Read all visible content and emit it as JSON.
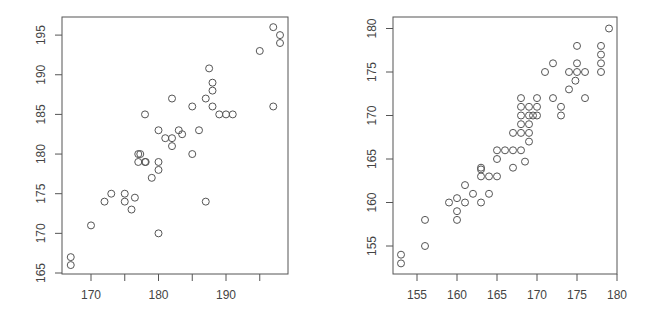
{
  "chart_data": [
    {
      "type": "scatter",
      "title": "",
      "xlabel": "",
      "ylabel": "",
      "xlim": [
        166,
        198.5
      ],
      "ylim": [
        164.8,
        197.5
      ],
      "xticks": [
        170,
        175,
        180,
        185,
        190,
        195
      ],
      "xtick_labels": [
        "170",
        "",
        "180",
        "",
        "190",
        ""
      ],
      "yticks": [
        165,
        170,
        175,
        180,
        185,
        190,
        195
      ],
      "ytick_labels": [
        "165",
        "170",
        "175",
        "180",
        "185",
        "190",
        "195"
      ],
      "grid": false,
      "legend": null,
      "marker": "open-circle",
      "color": "#555555",
      "frame": {
        "left": 62,
        "top": 17,
        "right": 288,
        "bottom": 274
      },
      "axis_px": {
        "x0": 170,
        "x0px": 91,
        "xscale": 6.75,
        "y0": 165,
        "y0px": 273,
        "yscale": 7.93
      },
      "points": [
        [
          167,
          167
        ],
        [
          167,
          166
        ],
        [
          170,
          171
        ],
        [
          172,
          174
        ],
        [
          173,
          175
        ],
        [
          175,
          175
        ],
        [
          175,
          174
        ],
        [
          176,
          173
        ],
        [
          176.5,
          174.5
        ],
        [
          177,
          180
        ],
        [
          177.3,
          180
        ],
        [
          177,
          179
        ],
        [
          178,
          179
        ],
        [
          178.1,
          179
        ],
        [
          178,
          185
        ],
        [
          179,
          177
        ],
        [
          180,
          179
        ],
        [
          180,
          178
        ],
        [
          180,
          183
        ],
        [
          180,
          170
        ],
        [
          181,
          182
        ],
        [
          182,
          182
        ],
        [
          182,
          181
        ],
        [
          182,
          187
        ],
        [
          183,
          183
        ],
        [
          183.5,
          182.5
        ],
        [
          185,
          186
        ],
        [
          185,
          180
        ],
        [
          186,
          183
        ],
        [
          187,
          187
        ],
        [
          187,
          174
        ],
        [
          187.5,
          190.8
        ],
        [
          188,
          189
        ],
        [
          188,
          188
        ],
        [
          188,
          186
        ],
        [
          189,
          185
        ],
        [
          190,
          185
        ],
        [
          191,
          185
        ],
        [
          195,
          193
        ],
        [
          197,
          196
        ],
        [
          197,
          186
        ],
        [
          198,
          195
        ],
        [
          198,
          194
        ]
      ]
    },
    {
      "type": "scatter",
      "title": "",
      "xlabel": "",
      "ylabel": "",
      "xlim": [
        152.9,
        180
      ],
      "ylim": [
        151.8,
        181.5
      ],
      "xticks": [
        155,
        160,
        165,
        170,
        175,
        180
      ],
      "xtick_labels": [
        "155",
        "160",
        "165",
        "170",
        "175",
        "180"
      ],
      "yticks": [
        155,
        160,
        165,
        170,
        175,
        180
      ],
      "ytick_labels": [
        "155",
        "160",
        "165",
        "170",
        "175",
        "180"
      ],
      "grid": false,
      "legend": null,
      "marker": "open-circle",
      "color": "#555555",
      "frame": {
        "left": 393,
        "top": 17,
        "right": 617,
        "bottom": 274
      },
      "axis_px": {
        "x0": 155,
        "x0px": 417,
        "xscale": 8.0,
        "y0": 155,
        "y0px": 246,
        "yscale": 8.7
      },
      "points": [
        [
          153,
          154
        ],
        [
          153,
          153
        ],
        [
          156,
          158
        ],
        [
          156,
          155
        ],
        [
          159,
          160
        ],
        [
          160,
          160.5
        ],
        [
          160,
          159
        ],
        [
          160,
          158
        ],
        [
          161,
          160
        ],
        [
          161,
          162
        ],
        [
          162,
          161
        ],
        [
          163,
          164
        ],
        [
          163,
          163.8
        ],
        [
          163,
          163
        ],
        [
          163,
          160
        ],
        [
          164,
          163
        ],
        [
          164,
          161
        ],
        [
          165,
          166
        ],
        [
          165,
          165
        ],
        [
          165,
          163
        ],
        [
          166,
          166
        ],
        [
          167,
          166
        ],
        [
          167,
          168
        ],
        [
          167,
          164
        ],
        [
          168,
          172
        ],
        [
          168,
          171
        ],
        [
          168,
          170
        ],
        [
          168,
          169
        ],
        [
          168,
          168
        ],
        [
          168,
          166
        ],
        [
          168.5,
          164.7
        ],
        [
          169,
          171
        ],
        [
          169,
          170
        ],
        [
          169,
          169
        ],
        [
          169,
          168
        ],
        [
          169,
          167
        ],
        [
          169.5,
          170
        ],
        [
          170,
          172
        ],
        [
          170,
          171
        ],
        [
          170,
          170
        ],
        [
          171,
          175
        ],
        [
          172,
          176
        ],
        [
          172,
          172
        ],
        [
          173,
          171
        ],
        [
          173,
          170
        ],
        [
          174,
          175
        ],
        [
          174,
          173
        ],
        [
          175,
          178
        ],
        [
          175,
          176
        ],
        [
          175,
          175
        ],
        [
          174.8,
          174
        ],
        [
          176,
          175
        ],
        [
          176,
          172
        ],
        [
          178,
          178
        ],
        [
          178,
          177
        ],
        [
          178,
          176
        ],
        [
          178,
          175
        ],
        [
          179,
          180
        ]
      ]
    }
  ]
}
